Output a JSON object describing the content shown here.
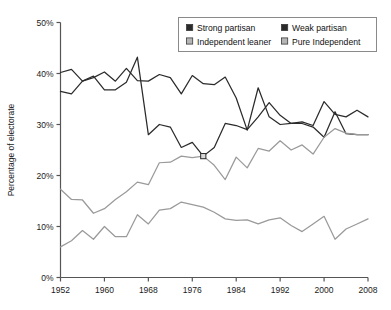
{
  "chart_data": {
    "type": "line",
    "title": "",
    "xlabel": "",
    "ylabel": "Percentage of electorate",
    "xlim": [
      1952,
      2008
    ],
    "ylim": [
      0,
      50
    ],
    "xticks": [
      "1952",
      "1960",
      "1968",
      "1976",
      "1984",
      "1992",
      "2000",
      "2008"
    ],
    "xtick_values": [
      1952,
      1960,
      1968,
      1976,
      1984,
      1992,
      2000,
      2008
    ],
    "yticks": [
      "0%",
      "10%",
      "20%",
      "30%",
      "40%",
      "50%"
    ],
    "ytick_values": [
      0,
      10,
      20,
      30,
      40,
      50
    ],
    "grid": false,
    "legend_position": "top-right",
    "x": [
      1952,
      1954,
      1956,
      1958,
      1960,
      1962,
      1964,
      1966,
      1968,
      1970,
      1972,
      1974,
      1976,
      1978,
      1980,
      1982,
      1984,
      1986,
      1988,
      1990,
      1992,
      1994,
      1996,
      1998,
      2000,
      2002,
      2004,
      2006,
      2008
    ],
    "series": [
      {
        "name": "Strong partisan",
        "color": "#2b2b2b",
        "values": [
          36.5,
          36.0,
          38.5,
          39.5,
          36.8,
          36.8,
          38.3,
          43.2,
          28.0,
          30.0,
          29.5,
          25.5,
          26.5,
          23.8,
          25.5,
          30.2,
          29.8,
          29.0,
          31.5,
          34.3,
          31.8,
          30.2,
          30.5,
          29.8,
          34.5,
          32.0,
          31.5,
          32.8,
          31.5
        ]
      },
      {
        "name": "Weak partisan",
        "color": "#2b2b2b",
        "values": [
          40.2,
          40.8,
          38.5,
          39.2,
          40.3,
          38.5,
          41.0,
          38.6,
          38.5,
          39.8,
          39.2,
          36.0,
          39.6,
          38.0,
          37.8,
          39.3,
          35.2,
          28.9,
          37.2,
          31.5,
          30.0,
          30.2,
          30.2,
          29.5,
          27.5,
          32.5,
          28.2,
          28.0,
          28.0
        ]
      },
      {
        "name": "Independent leaner",
        "color": "#9a9a9a",
        "values": [
          17.3,
          15.3,
          15.2,
          12.6,
          13.5,
          15.3,
          16.8,
          18.7,
          18.2,
          22.5,
          22.6,
          23.8,
          23.5,
          23.8,
          22.0,
          19.2,
          23.6,
          21.5,
          25.3,
          24.8,
          26.8,
          25.0,
          26.0,
          24.2,
          27.5,
          29.2,
          28.3,
          28.0,
          28.0
        ]
      },
      {
        "name": "Pure Independent",
        "color": "#9a9a9a",
        "values": [
          6.0,
          7.2,
          9.2,
          7.5,
          10.0,
          8.0,
          8.0,
          12.3,
          10.5,
          13.2,
          13.5,
          14.8,
          14.3,
          13.8,
          12.8,
          11.5,
          11.2,
          11.3,
          10.5,
          11.3,
          11.7,
          10.2,
          9.0,
          10.5,
          12.0,
          7.5,
          9.5,
          10.5,
          11.5
        ]
      }
    ]
  },
  "legend": {
    "entries": [
      {
        "label": "Strong partisan",
        "swatch": "#2b2b2b"
      },
      {
        "label": "Weak partisan",
        "swatch": "#2b2b2b"
      },
      {
        "label": "Independent leaner",
        "swatch": "#b5b5b5"
      },
      {
        "label": "Pure Independent",
        "swatch": "#b5b5b5"
      }
    ],
    "border_color": "#8a8a8a"
  },
  "axis": {
    "color": "#555555",
    "ylabel": "Percentage of electorate"
  }
}
